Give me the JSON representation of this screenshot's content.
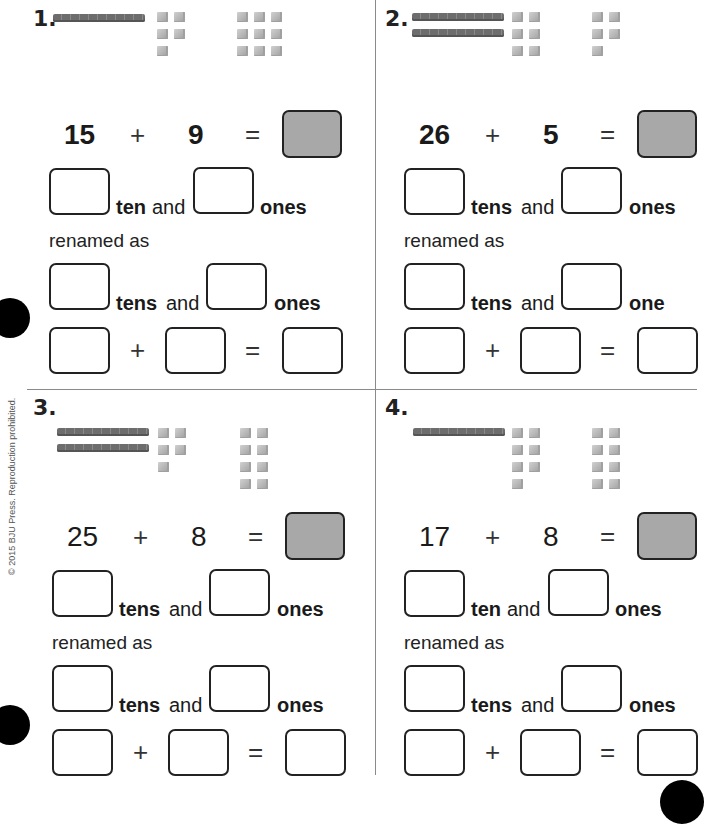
{
  "copyright": "© 2015 BJU Press. Reproduction prohibited.",
  "problems": [
    {
      "number": "1.",
      "blocks": {
        "tens_rods": 1,
        "ones_group_a": 5,
        "ones_group_b": 9
      },
      "equation": {
        "addend1": "15",
        "plus": "+",
        "addend2": "9",
        "equals": "=",
        "numbers_bold": true
      },
      "first_row": {
        "tens_word": "ten",
        "and_word": "and",
        "ones_word": "ones"
      },
      "renamed_label": "renamed as",
      "second_row": {
        "tens_word": "tens",
        "and_word": "and",
        "ones_word": "ones"
      },
      "final_row": {
        "plus": "+",
        "equals": "="
      }
    },
    {
      "number": "2.",
      "blocks": {
        "tens_rods": 2,
        "ones_group_a": 6,
        "ones_group_b": 5
      },
      "equation": {
        "addend1": "26",
        "plus": "+",
        "addend2": "5",
        "equals": "=",
        "numbers_bold": true
      },
      "first_row": {
        "tens_word": "tens",
        "and_word": "and",
        "ones_word": "ones"
      },
      "renamed_label": "renamed as",
      "second_row": {
        "tens_word": "tens",
        "and_word": "and",
        "ones_word": "one"
      },
      "final_row": {
        "plus": "+",
        "equals": "="
      }
    },
    {
      "number": "3.",
      "blocks": {
        "tens_rods": 2,
        "ones_group_a": 5,
        "ones_group_b": 8
      },
      "equation": {
        "addend1": "25",
        "plus": "+",
        "addend2": "8",
        "equals": "=",
        "numbers_bold": false
      },
      "first_row": {
        "tens_word": "tens",
        "and_word": "and",
        "ones_word": "ones"
      },
      "renamed_label": "renamed as",
      "second_row": {
        "tens_word": "tens",
        "and_word": "and",
        "ones_word": "ones"
      },
      "final_row": {
        "plus": "+",
        "equals": "="
      }
    },
    {
      "number": "4.",
      "blocks": {
        "tens_rods": 1,
        "ones_group_a": 7,
        "ones_group_b": 8
      },
      "equation": {
        "addend1": "17",
        "plus": "+",
        "addend2": "8",
        "equals": "=",
        "numbers_bold": false
      },
      "first_row": {
        "tens_word": "ten",
        "and_word": "and",
        "ones_word": "ones"
      },
      "renamed_label": "renamed as",
      "second_row": {
        "tens_word": "tens",
        "and_word": "and",
        "ones_word": "ones"
      },
      "final_row": {
        "plus": "+",
        "equals": "="
      }
    }
  ],
  "colors": {
    "answer_box_shade": "#a8a8a8",
    "divider": "#8a8a8a",
    "rod": "#6d6d6d",
    "cube": "#bdbdbd"
  }
}
